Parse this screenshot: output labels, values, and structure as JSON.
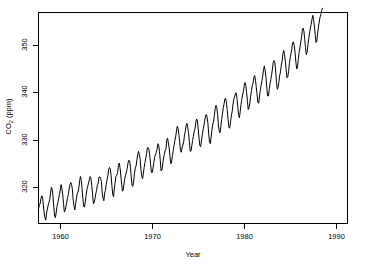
{
  "chart_data": {
    "type": "line",
    "title": "",
    "xlabel": "Year",
    "ylabel_text": "CO",
    "ylabel_sub": "2",
    "ylabel_unit": " (ppm)",
    "ylabel_full": "CO2 (ppm)",
    "xlim": [
      1959.0,
      1990.92
    ],
    "ylim": [
      312.5,
      355.5
    ],
    "xticks": [
      1960,
      1970,
      1980,
      1990
    ],
    "xtick_labels": [
      "1960",
      "1970",
      "1980",
      "1990"
    ],
    "yticks": [
      320,
      330,
      340,
      350
    ],
    "ytick_labels": [
      "320",
      "330",
      "340",
      "350"
    ],
    "grid": false,
    "legend": "none",
    "line_color": "#000000",
    "line_width": 1,
    "background": "#ffffff",
    "series_name": "Monthly mean atmospheric CO2 (Mauna Loa)",
    "x_start": 1959.0,
    "x_step": 0.0833333,
    "values": [
      315.42,
      316.31,
      316.5,
      317.56,
      318.13,
      318.0,
      316.39,
      314.65,
      313.68,
      313.18,
      314.66,
      315.43,
      316.27,
      316.81,
      317.42,
      318.87,
      319.87,
      319.43,
      318.01,
      315.74,
      314.0,
      313.68,
      314.84,
      316.03,
      316.73,
      317.54,
      318.38,
      319.31,
      320.42,
      319.61,
      318.42,
      316.63,
      314.83,
      315.16,
      315.94,
      316.85,
      317.78,
      318.4,
      319.53,
      320.42,
      320.85,
      320.45,
      319.45,
      317.25,
      316.11,
      315.27,
      316.53,
      317.53,
      318.58,
      318.92,
      319.7,
      321.22,
      322.08,
      321.31,
      319.58,
      317.61,
      316.05,
      315.83,
      316.91,
      318.2,
      319.41,
      320.07,
      320.74,
      321.4,
      322.06,
      321.73,
      320.27,
      318.54,
      316.54,
      316.71,
      317.53,
      318.55,
      319.27,
      320.28,
      320.73,
      321.97,
      322.0,
      321.71,
      321.05,
      318.71,
      317.66,
      317.14,
      318.7,
      319.25,
      320.46,
      321.43,
      322.23,
      323.54,
      323.91,
      323.59,
      322.24,
      320.2,
      318.48,
      317.94,
      319.63,
      320.87,
      322.17,
      322.34,
      322.88,
      324.25,
      324.83,
      323.93,
      322.38,
      320.76,
      319.1,
      319.24,
      320.56,
      321.8,
      322.4,
      322.99,
      323.73,
      324.86,
      325.4,
      325.2,
      323.98,
      321.95,
      320.18,
      320.09,
      321.16,
      322.74,
      323.83,
      324.26,
      325.47,
      326.5,
      327.21,
      326.54,
      325.72,
      323.5,
      322.22,
      321.62,
      322.69,
      323.95,
      324.89,
      325.82,
      326.77,
      327.97,
      327.91,
      327.5,
      326.18,
      324.53,
      322.93,
      322.9,
      323.85,
      324.96,
      326.01,
      326.51,
      327.01,
      327.62,
      328.76,
      328.4,
      327.2,
      325.27,
      323.2,
      323.4,
      324.63,
      325.85,
      326.6,
      327.47,
      327.58,
      329.56,
      329.9,
      328.92,
      327.88,
      326.16,
      324.68,
      325.04,
      326.34,
      327.39,
      328.37,
      329.4,
      330.14,
      331.33,
      332.31,
      331.9,
      330.7,
      329.15,
      327.35,
      327.02,
      327.99,
      328.48,
      329.18,
      330.55,
      331.32,
      332.48,
      332.92,
      332.08,
      331.01,
      329.23,
      327.27,
      327.21,
      328.29,
      329.41,
      330.23,
      331.25,
      331.87,
      333.14,
      333.8,
      333.43,
      331.73,
      329.9,
      328.4,
      328.17,
      329.32,
      330.59,
      331.58,
      332.39,
      333.33,
      334.41,
      334.71,
      334.17,
      332.89,
      330.77,
      329.14,
      328.78,
      330.14,
      331.52,
      332.75,
      333.24,
      334.53,
      335.9,
      336.57,
      336.1,
      334.76,
      332.59,
      331.42,
      330.98,
      332.24,
      333.68,
      334.8,
      336.07,
      336.82,
      337.88,
      338.0,
      337.1,
      335.5,
      333.66,
      332.13,
      331.92,
      333.19,
      334.42,
      335.25,
      336.65,
      337.8,
      338.3,
      338.88,
      339.14,
      337.98,
      336.4,
      334.74,
      334.01,
      335.27,
      336.71,
      337.79,
      338.7,
      339.35,
      340.54,
      341.21,
      340.62,
      339.19,
      337.39,
      335.73,
      336.1,
      337.08,
      338.44,
      339.59,
      340.61,
      341.12,
      342.3,
      342.65,
      341.66,
      340.22,
      338.69,
      337.15,
      337.02,
      338.49,
      339.75,
      340.72,
      341.6,
      342.58,
      343.94,
      344.61,
      343.6,
      342.31,
      340.13,
      338.52,
      338.48,
      339.78,
      340.98,
      341.83,
      342.88,
      343.98,
      345.34,
      345.71,
      345.27,
      343.58,
      341.41,
      339.83,
      340.18,
      341.3,
      342.71,
      343.41,
      344.8,
      345.58,
      347.13,
      347.75,
      346.92,
      345.56,
      343.8,
      342.2,
      342.37,
      343.51,
      345.15,
      346.28,
      347.16,
      348.15,
      349.31,
      349.51,
      348.78,
      347.44,
      345.5,
      343.98,
      344.24,
      345.93,
      347.34,
      348.26,
      349.47,
      350.33,
      351.87,
      352.31,
      351.69,
      350.04,
      348.34,
      346.9,
      347.42,
      348.92,
      350.21,
      351.34,
      352.33,
      353.05,
      354.13,
      354.92,
      354.07,
      352.74,
      351.0,
      349.4,
      349.65,
      351.23,
      352.51,
      353.56,
      354.53,
      355.04,
      355.9,
      356.35
    ]
  }
}
